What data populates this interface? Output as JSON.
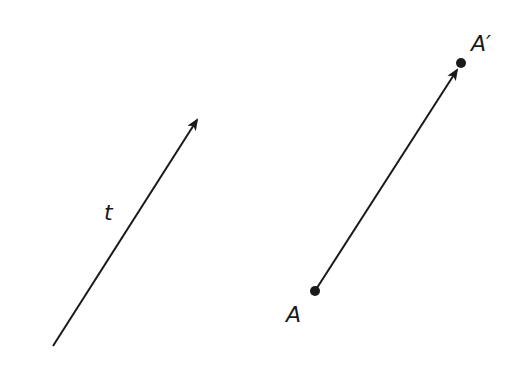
{
  "diagram": {
    "colors": {
      "ink": "#1a1a1a",
      "background": "#ffffff"
    },
    "vector_t": {
      "label": "t",
      "start": [
        53,
        346
      ],
      "end": [
        198,
        118
      ],
      "label_pos": [
        104,
        220
      ]
    },
    "translation": {
      "point_A": {
        "label": "A",
        "pos": [
          315,
          291
        ],
        "label_pos": [
          286,
          322
        ]
      },
      "point_A_prime": {
        "label": "A′",
        "pos": [
          461,
          63
        ],
        "label_pos": [
          471,
          51
        ]
      }
    }
  }
}
